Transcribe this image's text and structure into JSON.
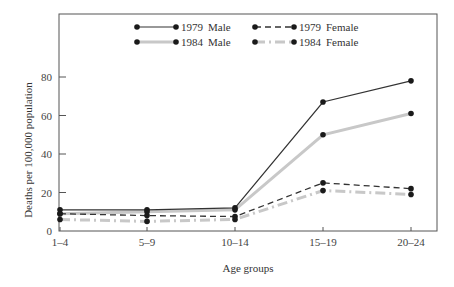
{
  "chart_data": {
    "type": "line",
    "title": "",
    "xlabel": "Age groups",
    "ylabel": "Deaths per 100,000 population",
    "categories": [
      "1–4",
      "5–9",
      "10–14",
      "15–19",
      "20–24"
    ],
    "ylim": [
      0,
      110
    ],
    "yticks": [
      0,
      20,
      40,
      60,
      80
    ],
    "grid": false,
    "legend_position": "top-inside",
    "series": [
      {
        "name": "1979 Male",
        "year": "1979",
        "sex": "Male",
        "style": "solid",
        "color": "#333333",
        "width": 1.2,
        "values": [
          11,
          11,
          12,
          67,
          78
        ]
      },
      {
        "name": "1984 Male",
        "year": "1984",
        "sex": "Male",
        "style": "solid",
        "color": "#c8c8c8",
        "width": 3,
        "values": [
          9,
          10,
          11,
          50,
          61
        ]
      },
      {
        "name": "1979 Female",
        "year": "1979",
        "sex": "Female",
        "style": "dashed",
        "color": "#333333",
        "width": 1.3,
        "values": [
          9,
          8,
          7.5,
          25,
          22
        ]
      },
      {
        "name": "1984 Female",
        "year": "1984",
        "sex": "Female",
        "style": "dashdot",
        "color": "#c8c8c8",
        "width": 3,
        "values": [
          6,
          5,
          6,
          21,
          19
        ]
      }
    ]
  },
  "legend": {
    "items": [
      {
        "year": "1979",
        "sex": "Male"
      },
      {
        "year": "1979",
        "sex": "Female"
      },
      {
        "year": "1984",
        "sex": "Male"
      },
      {
        "year": "1984",
        "sex": "Female"
      }
    ]
  }
}
